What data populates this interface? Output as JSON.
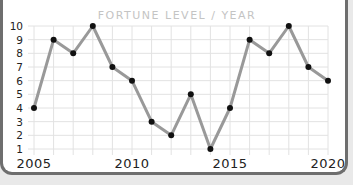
{
  "chart_data": {
    "type": "line",
    "title": "FORTUNE LEVEL / YEAR",
    "xlabel": "",
    "ylabel": "",
    "x": [
      2005,
      2006,
      2007,
      2008,
      2009,
      2010,
      2011,
      2012,
      2013,
      2014,
      2015,
      2016,
      2017,
      2018,
      2019,
      2020
    ],
    "series": [
      {
        "name": "Fortune Level",
        "values": [
          4,
          9,
          8,
          10,
          7,
          6,
          3,
          2,
          5,
          1,
          4,
          9,
          8,
          10,
          7,
          6
        ]
      }
    ],
    "xticks": [
      "2005",
      "2010",
      "2015",
      "2020"
    ],
    "yticks": [
      "1",
      "2",
      "3",
      "4",
      "5",
      "6",
      "7",
      "8",
      "9",
      "10"
    ],
    "xlim": [
      2005,
      2020
    ],
    "ylim": [
      1,
      10
    ],
    "grid": true,
    "legend": "none",
    "colors": {
      "line": "#999999",
      "marker": "#111111",
      "grid": "#e2e2e2"
    }
  }
}
